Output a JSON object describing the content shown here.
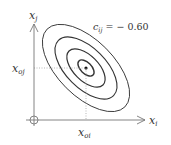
{
  "diagram": {
    "type": "bivariate-gaussian-contours",
    "annotation": {
      "text": "c",
      "sub": "ij",
      "rest": " = − 0.60"
    },
    "axes": {
      "x_label": {
        "main": "x",
        "sub": "i"
      },
      "y_label": {
        "main": "x",
        "sub": "j"
      }
    },
    "center_labels": {
      "x": {
        "main": "x",
        "sub": "oi"
      },
      "y": {
        "main": "x",
        "sub": "oj"
      }
    },
    "correlation": -0.6,
    "contour_count": 4,
    "colors": {
      "axis": "#777777",
      "contour": "#333333",
      "guide": "#999999"
    }
  }
}
